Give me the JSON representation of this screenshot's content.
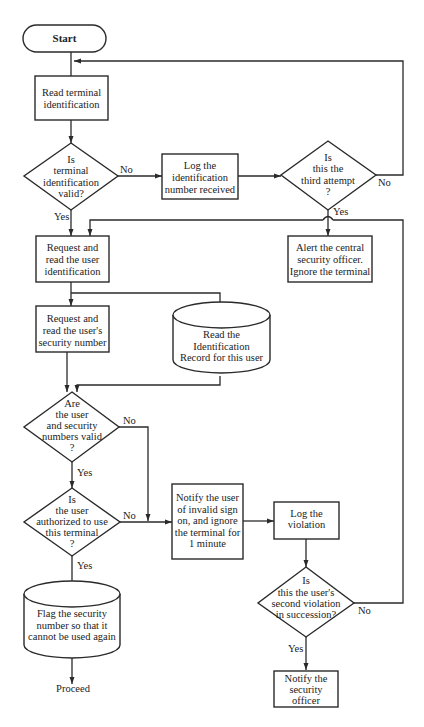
{
  "diagram": {
    "type": "flowchart",
    "nodes": {
      "start": {
        "shape": "terminator",
        "lines": [
          "Start"
        ]
      },
      "read_terminal": {
        "shape": "process",
        "lines": [
          "Read terminal",
          "identification"
        ]
      },
      "terminal_valid": {
        "shape": "decision",
        "lines": [
          "Is",
          "terminal",
          "identification",
          "valid?"
        ]
      },
      "log_id": {
        "shape": "process",
        "lines": [
          "Log the",
          "identification",
          "number received"
        ]
      },
      "third_attempt": {
        "shape": "decision",
        "lines": [
          "Is",
          "this the",
          "third attempt",
          "?"
        ]
      },
      "alert_officer": {
        "shape": "process",
        "lines": [
          "Alert the central",
          "security officer.",
          "Ignore the terminal"
        ]
      },
      "request_user_id": {
        "shape": "process",
        "lines": [
          "Request and",
          "read the user",
          "identification"
        ]
      },
      "request_security": {
        "shape": "process",
        "lines": [
          "Request and",
          "read the user's",
          "security number"
        ]
      },
      "read_record": {
        "shape": "storage",
        "lines": [
          "Read the",
          "Identification",
          "Record for this user"
        ]
      },
      "numbers_valid": {
        "shape": "decision",
        "lines": [
          "Are",
          "the user",
          "and security",
          "numbers valid",
          "?"
        ]
      },
      "authorized": {
        "shape": "decision",
        "lines": [
          "Is",
          "the user",
          "authorized to use",
          "this terminal",
          "?"
        ]
      },
      "notify_user": {
        "shape": "process",
        "lines": [
          "Notify the user",
          "of invalid sign",
          "on, and ignore",
          "the terminal for",
          "1 minute"
        ]
      },
      "log_violation": {
        "shape": "process",
        "lines": [
          "Log the",
          "violation"
        ]
      },
      "second_violation": {
        "shape": "decision",
        "lines": [
          "Is",
          "this the user's",
          "second violation",
          "in succession?"
        ]
      },
      "flag_number": {
        "shape": "storage",
        "lines": [
          "Flag the security",
          "number so that it",
          "cannot be used again"
        ]
      },
      "notify_officer": {
        "shape": "process",
        "lines": [
          "Notify the",
          "security",
          "officer"
        ]
      },
      "proceed": {
        "shape": "label",
        "lines": [
          "Proceed"
        ]
      }
    },
    "edge_labels": {
      "terminal_valid_no": "No",
      "terminal_valid_yes": "Yes",
      "third_attempt_no": "No",
      "third_attempt_yes": "Yes",
      "numbers_valid_no": "No",
      "numbers_valid_yes": "Yes",
      "authorized_no": "No",
      "authorized_yes": "Yes",
      "second_violation_no": "No",
      "second_violation_yes": "Yes"
    }
  }
}
